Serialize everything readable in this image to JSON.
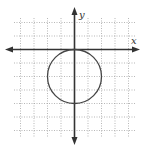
{
  "chart_data": {
    "type": "line",
    "title": "",
    "xlabel": "x",
    "ylabel": "y",
    "xlim": [
      -4,
      4
    ],
    "ylim": [
      -6,
      4
    ],
    "grid": true,
    "grid_style": "dotted",
    "tick_labels": false,
    "series": [
      {
        "name": "circle",
        "shape": "circle",
        "center": [
          0,
          -2
        ],
        "radius": 2,
        "equation": "x^2 + (y + 2)^2 = 4"
      }
    ]
  },
  "labels": {
    "x_axis": "x",
    "y_axis": "y"
  },
  "colors": {
    "grid": "#9a9a9a",
    "axis": "#333333",
    "curve": "#444444"
  }
}
